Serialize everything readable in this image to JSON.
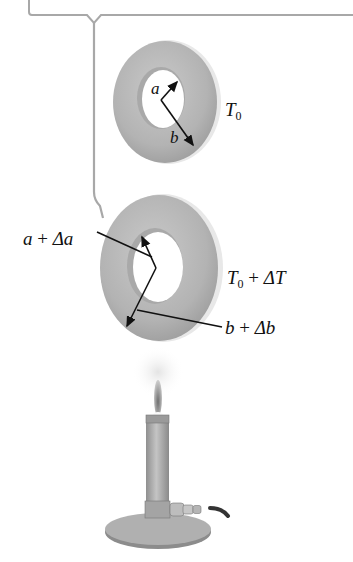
{
  "figure": {
    "colors": {
      "washer": "#b9b9b9",
      "washer_dark": "#9a9a9a",
      "washer_edge": "#e6e6e6",
      "bracket": "#a8a8a8",
      "arrow": "#111111",
      "flame": "#8a8a8a",
      "burner": "#a6a6a6"
    },
    "initial_state": {
      "inner_radius_label": "a",
      "outer_radius_label": "b",
      "temperature_label_var": "T",
      "temperature_label_sub": "0"
    },
    "heated_state": {
      "inner_radius_label": {
        "var": "a",
        "op": "+",
        "delta": "Δa"
      },
      "outer_radius_label": {
        "var": "b",
        "op": "+",
        "delta": "Δb"
      },
      "temperature_label": {
        "var": "T",
        "sub": "0",
        "op": "+",
        "delta": "ΔT"
      }
    },
    "heat_source": "bunsen-burner"
  }
}
